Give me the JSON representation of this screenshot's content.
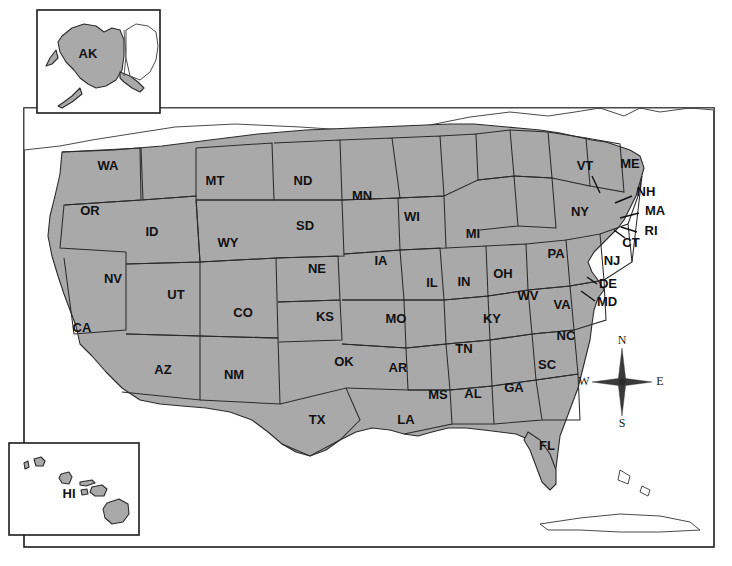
{
  "map": {
    "title": "United States Map with State Abbreviations",
    "colors": {
      "state_fill": "#a9a9a9",
      "state_border": "#2b2b2b",
      "water": "#ffffff",
      "frame": "#1c1c1c",
      "label_text": "#111111",
      "background": "#ffffff"
    },
    "frame": {
      "x": 24,
      "y": 108,
      "width": 690,
      "height": 439
    },
    "states": [
      {
        "abbr": "WA",
        "x": 108,
        "y": 167,
        "leader": null
      },
      {
        "abbr": "OR",
        "x": 90,
        "y": 212,
        "leader": null
      },
      {
        "abbr": "ID",
        "x": 152,
        "y": 233,
        "leader": null
      },
      {
        "abbr": "MT",
        "x": 215,
        "y": 182,
        "leader": null
      },
      {
        "abbr": "WY",
        "x": 228,
        "y": 244,
        "leader": null
      },
      {
        "abbr": "NV",
        "x": 113,
        "y": 280,
        "leader": null
      },
      {
        "abbr": "UT",
        "x": 176,
        "y": 296,
        "leader": null
      },
      {
        "abbr": "CA",
        "x": 82,
        "y": 329,
        "leader": null
      },
      {
        "abbr": "AZ",
        "x": 163,
        "y": 371,
        "leader": null
      },
      {
        "abbr": "NM",
        "x": 234,
        "y": 376,
        "leader": null
      },
      {
        "abbr": "CO",
        "x": 243,
        "y": 314,
        "leader": null
      },
      {
        "abbr": "ND",
        "x": 303,
        "y": 182,
        "leader": null
      },
      {
        "abbr": "SD",
        "x": 305,
        "y": 227,
        "leader": null
      },
      {
        "abbr": "NE",
        "x": 317,
        "y": 270,
        "leader": null
      },
      {
        "abbr": "KS",
        "x": 325,
        "y": 318,
        "leader": null
      },
      {
        "abbr": "OK",
        "x": 344,
        "y": 363,
        "leader": null
      },
      {
        "abbr": "TX",
        "x": 317,
        "y": 421,
        "leader": null
      },
      {
        "abbr": "MN",
        "x": 362,
        "y": 197,
        "leader": null
      },
      {
        "abbr": "IA",
        "x": 381,
        "y": 262,
        "leader": null
      },
      {
        "abbr": "MO",
        "x": 396,
        "y": 320,
        "leader": null
      },
      {
        "abbr": "AR",
        "x": 398,
        "y": 369,
        "leader": null
      },
      {
        "abbr": "LA",
        "x": 406,
        "y": 421,
        "leader": null
      },
      {
        "abbr": "WI",
        "x": 412,
        "y": 218,
        "leader": null
      },
      {
        "abbr": "IL",
        "x": 432,
        "y": 284,
        "leader": null
      },
      {
        "abbr": "MS",
        "x": 438,
        "y": 396,
        "leader": null
      },
      {
        "abbr": "MI",
        "x": 473,
        "y": 235,
        "leader": null
      },
      {
        "abbr": "IN",
        "x": 464,
        "y": 283,
        "leader": null
      },
      {
        "abbr": "KY",
        "x": 492,
        "y": 320,
        "leader": null
      },
      {
        "abbr": "TN",
        "x": 464,
        "y": 350,
        "leader": null
      },
      {
        "abbr": "AL",
        "x": 473,
        "y": 395,
        "leader": null
      },
      {
        "abbr": "OH",
        "x": 503,
        "y": 275,
        "leader": null
      },
      {
        "abbr": "GA",
        "x": 514,
        "y": 389,
        "leader": null
      },
      {
        "abbr": "FL",
        "x": 547,
        "y": 447,
        "leader": null
      },
      {
        "abbr": "WV",
        "x": 528,
        "y": 297,
        "leader": null
      },
      {
        "abbr": "SC",
        "x": 547,
        "y": 366,
        "leader": null
      },
      {
        "abbr": "NC",
        "x": 566,
        "y": 337,
        "leader": null
      },
      {
        "abbr": "VA",
        "x": 562,
        "y": 306,
        "leader": null
      },
      {
        "abbr": "PA",
        "x": 556,
        "y": 255,
        "leader": null
      },
      {
        "abbr": "NY",
        "x": 580,
        "y": 213,
        "leader": null
      },
      {
        "abbr": "VT",
        "x": 585,
        "y": 167,
        "leader": {
          "x1": 592,
          "y1": 176,
          "x2": 600,
          "y2": 193
        }
      },
      {
        "abbr": "ME",
        "x": 630,
        "y": 165,
        "leader": null
      },
      {
        "abbr": "NH",
        "x": 646,
        "y": 193,
        "leader": {
          "x1": 632,
          "y1": 196,
          "x2": 615,
          "y2": 203
        }
      },
      {
        "abbr": "MA",
        "x": 655,
        "y": 212,
        "leader": {
          "x1": 639,
          "y1": 213,
          "x2": 620,
          "y2": 218
        }
      },
      {
        "abbr": "RI",
        "x": 651,
        "y": 232,
        "leader": {
          "x1": 637,
          "y1": 232,
          "x2": 621,
          "y2": 227
        }
      },
      {
        "abbr": "CT",
        "x": 631,
        "y": 244,
        "leader": {
          "x1": 625,
          "y1": 238,
          "x2": 614,
          "y2": 230
        }
      },
      {
        "abbr": "NJ",
        "x": 612,
        "y": 262,
        "leader": null
      },
      {
        "abbr": "DE",
        "x": 608,
        "y": 285,
        "leader": {
          "x1": 597,
          "y1": 284,
          "x2": 587,
          "y2": 277
        }
      },
      {
        "abbr": "MD",
        "x": 607,
        "y": 303,
        "leader": {
          "x1": 595,
          "y1": 301,
          "x2": 581,
          "y2": 291
        }
      }
    ],
    "insets": [
      {
        "name": "alaska-inset",
        "abbr": "AK",
        "box": {
          "x": 37,
          "y": 10,
          "width": 123,
          "height": 103
        },
        "label_x": 88,
        "label_y": 55
      },
      {
        "name": "hawaii-inset",
        "abbr": "HI",
        "box": {
          "x": 9,
          "y": 443,
          "width": 130,
          "height": 92
        },
        "label_x": 69,
        "label_y": 495
      }
    ],
    "compass": {
      "name": "compass-rose",
      "center_x": 622,
      "center_y": 382,
      "north": "N",
      "east": "E",
      "south": "S",
      "west": "W"
    }
  }
}
